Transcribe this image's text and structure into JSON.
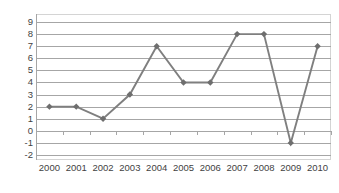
{
  "chart_data": {
    "type": "line",
    "title": "",
    "subtitle": "",
    "xlabel": "",
    "ylabel": "",
    "categories": [
      "2000",
      "2001",
      "2002",
      "2003",
      "2004",
      "2005",
      "2006",
      "2007",
      "2008",
      "2009",
      "2010"
    ],
    "values": [
      2,
      2,
      1,
      3,
      7,
      4,
      4,
      8,
      8,
      -1,
      7
    ],
    "series": [
      {
        "name": "Series 1",
        "values": [
          2,
          2,
          1,
          3,
          7,
          4,
          4,
          8,
          8,
          -1,
          7
        ]
      }
    ],
    "ylim": [
      -2,
      9
    ],
    "ytick_labels": [
      "9",
      "8",
      "7",
      "6",
      "5",
      "4",
      "3",
      "2",
      "1",
      "0",
      "-1",
      "-2"
    ],
    "ytick_values": [
      9,
      8,
      7,
      6,
      5,
      4,
      3,
      2,
      1,
      0,
      -1,
      -2
    ],
    "grid": true,
    "grid_axis": "y",
    "legend": false,
    "legend_position": "none",
    "marker": "diamond",
    "colors": {
      "line": "#7f7f7f",
      "marker": "#6e6e6e",
      "gridline": "#a6a6a6",
      "axis": "#a6a6a6",
      "border": "#d4d4d4",
      "tick_text": "#3f3f3f",
      "background": "#ffffff"
    }
  }
}
